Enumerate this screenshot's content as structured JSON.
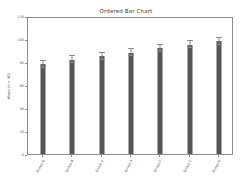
{
  "chart_data": {
    "type": "bar",
    "title": "Ordered Bar Chart",
    "xlabel": "",
    "ylabel": "Mean (n = 40)",
    "categories": [
      "Group G",
      "Group B",
      "Group E",
      "Group A",
      "Group F",
      "Group C",
      "Group D"
    ],
    "values": [
      78,
      82,
      85,
      88,
      92,
      95,
      98
    ],
    "errors": [
      3,
      3,
      3,
      3,
      3,
      3,
      3
    ],
    "ylim": [
      0,
      120
    ],
    "yticks": [
      0,
      20,
      40,
      60,
      80,
      100,
      120
    ],
    "ytick_labels": [
      "0",
      "20",
      "40",
      "60",
      "80",
      "100",
      "120"
    ],
    "grid": false,
    "legend": null,
    "bar_color": "#565656",
    "error_color": "#8a8a8a",
    "frame_color": "#8d8d8d",
    "background": "#ffffff"
  }
}
